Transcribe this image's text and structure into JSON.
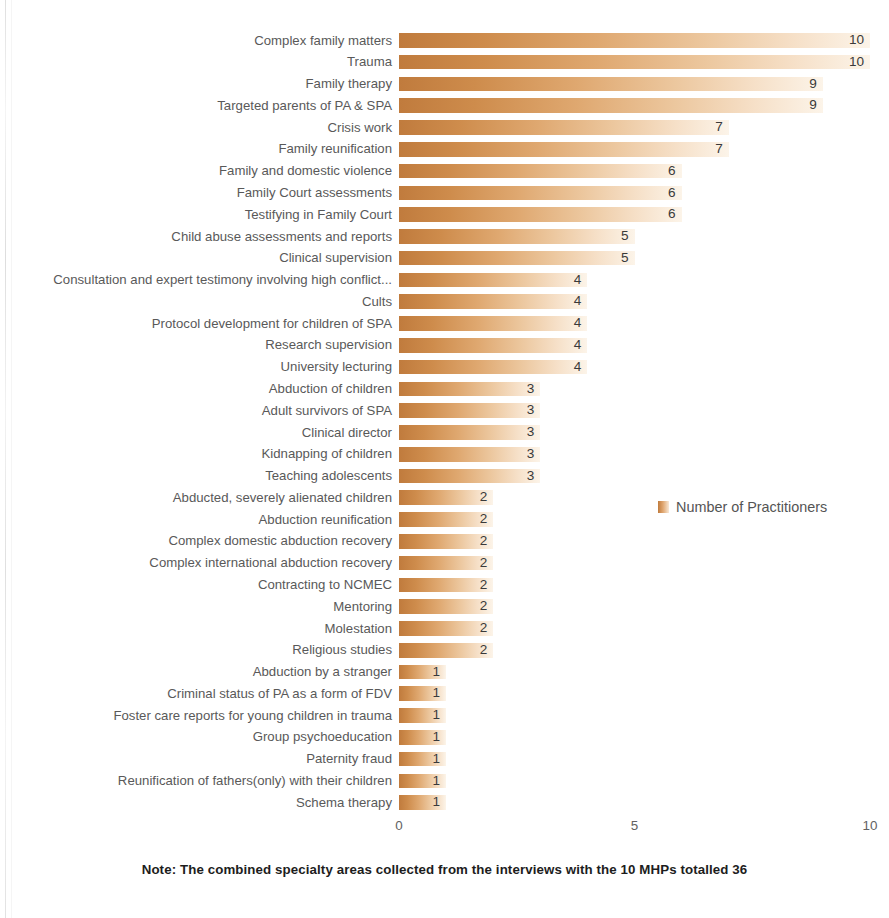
{
  "chart_data": {
    "type": "bar",
    "orientation": "horizontal",
    "title": "",
    "xlabel": "",
    "ylabel": "",
    "xlim": [
      0,
      10
    ],
    "xticks": [
      "0",
      "5",
      "10"
    ],
    "xtick_values": [
      0,
      5,
      10
    ],
    "grid": false,
    "legend_position": "middle-right",
    "series": [
      {
        "name": "Number of Practitioners",
        "values": [
          10,
          10,
          9,
          9,
          7,
          7,
          6,
          6,
          6,
          5,
          5,
          4,
          4,
          4,
          4,
          4,
          3,
          3,
          3,
          3,
          3,
          2,
          2,
          2,
          2,
          2,
          2,
          2,
          2,
          1,
          1,
          1,
          1,
          1,
          1,
          1
        ]
      }
    ],
    "categories": [
      "Complex family matters",
      "Trauma",
      "Family therapy",
      "Targeted parents of PA & SPA",
      "Crisis work",
      "Family reunification",
      "Family and domestic violence",
      "Family Court assessments",
      "Testifying in Family Court",
      "Child abuse assessments and reports",
      "Clinical supervision",
      "Consultation and expert testimony involving high conflict...",
      "Cults",
      "Protocol development for children of SPA",
      "Research supervision",
      "University lecturing",
      "Abduction of children",
      "Adult survivors of SPA",
      "Clinical director",
      "Kidnapping of children",
      "Teaching adolescents",
      "Abducted, severely alienated children",
      "Abduction reunification",
      "Complex domestic abduction recovery",
      "Complex international abduction recovery",
      "Contracting to NCMEC",
      "Mentoring",
      "Molestation",
      "Religious studies",
      "Abduction by a stranger",
      "Criminal status of PA as a form of FDV",
      "Foster care reports for young children in trauma",
      "Group psychoeducation",
      "Paternity fraud",
      "Reunification of fathers(only) with their children",
      "Schema therapy"
    ],
    "annotations": [
      "Note: The combined specialty areas collected from the interviews with the 10 MHPs totalled 36"
    ],
    "colors": {
      "bar_gradient_start": "#C07B3D",
      "bar_gradient_end": "#FCF4E9",
      "label_text": "#595959",
      "value_text": "#3a3a3a",
      "background": "#FFFFFF"
    }
  },
  "legend": {
    "entries": [
      {
        "label": "Number of Practitioners",
        "marker": "square-swatch-icon",
        "color": "#C07B3D"
      }
    ]
  },
  "axis": {
    "x_ticks": [
      "0",
      "5",
      "10"
    ]
  },
  "note": {
    "text": "Note: The combined specialty areas collected from the interviews with the 10 MHPs totalled 36"
  }
}
